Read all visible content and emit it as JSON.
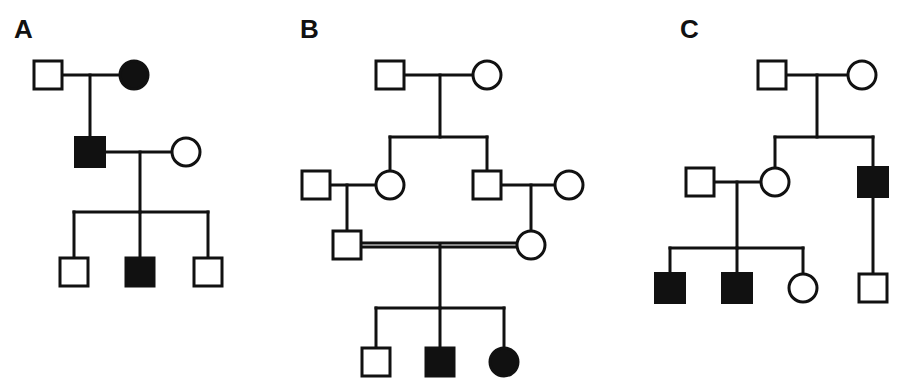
{
  "figure": {
    "background_color": "#ffffff",
    "line_color": "#111111",
    "affected_fill": "#111111",
    "unaffected_fill": "#ffffff",
    "stroke_width": 3,
    "width": 905,
    "height": 391
  },
  "legend_semantics": {
    "square": "male",
    "circle": "female",
    "filled": "affected",
    "open": "unaffected",
    "double_horizontal_line": "consanguineous mating"
  },
  "panels": [
    {
      "id": "A",
      "label": "A",
      "label_x": 14,
      "label_y": 38,
      "generations": 3,
      "individuals": [
        {
          "id": "A-I-1",
          "shape": "square",
          "sex": "male",
          "affected": false,
          "generation": 1,
          "cx": 48,
          "cy": 75,
          "size": 28
        },
        {
          "id": "A-I-2",
          "shape": "circle",
          "sex": "female",
          "affected": true,
          "generation": 1,
          "cx": 134,
          "cy": 75,
          "size": 28
        },
        {
          "id": "A-II-1",
          "shape": "square",
          "sex": "male",
          "affected": true,
          "generation": 2,
          "cx": 90,
          "cy": 152,
          "size": 29
        },
        {
          "id": "A-II-2",
          "shape": "circle",
          "sex": "female",
          "affected": false,
          "generation": 2,
          "cx": 186,
          "cy": 152,
          "size": 28
        },
        {
          "id": "A-III-1",
          "shape": "square",
          "sex": "male",
          "affected": false,
          "generation": 3,
          "cx": 74,
          "cy": 272,
          "size": 28
        },
        {
          "id": "A-III-2",
          "shape": "square",
          "sex": "male",
          "affected": true,
          "generation": 3,
          "cx": 140,
          "cy": 272,
          "size": 28
        },
        {
          "id": "A-III-3",
          "shape": "square",
          "sex": "male",
          "affected": false,
          "generation": 3,
          "cx": 208,
          "cy": 272,
          "size": 28
        }
      ],
      "matings": [
        {
          "id": "A-mating-1",
          "type": "single",
          "x1": 62,
          "x2": 120,
          "y": 75,
          "drop_x": 90,
          "drop_to": 138
        },
        {
          "id": "A-mating-2",
          "type": "single",
          "x1": 105,
          "x2": 172,
          "y": 152,
          "drop_x": 140,
          "drop_to": 212
        }
      ],
      "sibships": [
        {
          "id": "A-sibship-1",
          "y": 212,
          "x1": 74,
          "x2": 208,
          "children_x": [
            74,
            140,
            208
          ],
          "child_top": 258
        }
      ]
    },
    {
      "id": "B",
      "label": "B",
      "label_x": 300,
      "label_y": 38,
      "generations": 4,
      "individuals": [
        {
          "id": "B-I-1",
          "shape": "square",
          "sex": "male",
          "affected": false,
          "generation": 1,
          "cx": 390,
          "cy": 75,
          "size": 28
        },
        {
          "id": "B-I-2",
          "shape": "circle",
          "sex": "female",
          "affected": false,
          "generation": 1,
          "cx": 487,
          "cy": 75,
          "size": 28
        },
        {
          "id": "B-II-1",
          "shape": "square",
          "sex": "male",
          "affected": false,
          "generation": 2,
          "cx": 316,
          "cy": 185,
          "size": 28
        },
        {
          "id": "B-II-2",
          "shape": "circle",
          "sex": "female",
          "affected": false,
          "generation": 2,
          "cx": 390,
          "cy": 185,
          "size": 28
        },
        {
          "id": "B-II-3",
          "shape": "square",
          "sex": "male",
          "affected": false,
          "generation": 2,
          "cx": 487,
          "cy": 185,
          "size": 28
        },
        {
          "id": "B-II-4",
          "shape": "circle",
          "sex": "female",
          "affected": false,
          "generation": 2,
          "cx": 569,
          "cy": 185,
          "size": 28
        },
        {
          "id": "B-III-1",
          "shape": "square",
          "sex": "male",
          "affected": false,
          "generation": 3,
          "cx": 347,
          "cy": 245,
          "size": 28
        },
        {
          "id": "B-III-2",
          "shape": "circle",
          "sex": "female",
          "affected": false,
          "generation": 3,
          "cx": 531,
          "cy": 245,
          "size": 28
        },
        {
          "id": "B-IV-1",
          "shape": "square",
          "sex": "male",
          "affected": false,
          "generation": 4,
          "cx": 376,
          "cy": 362,
          "size": 28
        },
        {
          "id": "B-IV-2",
          "shape": "square",
          "sex": "male",
          "affected": true,
          "generation": 4,
          "cx": 440,
          "cy": 362,
          "size": 28
        },
        {
          "id": "B-IV-3",
          "shape": "circle",
          "sex": "female",
          "affected": true,
          "generation": 4,
          "cx": 504,
          "cy": 362,
          "size": 28
        }
      ],
      "matings": [
        {
          "id": "B-mating-1",
          "type": "single",
          "x1": 404,
          "x2": 473,
          "y": 75,
          "drop_x": 440,
          "drop_to": 137
        },
        {
          "id": "B-mating-2",
          "type": "single",
          "x1": 330,
          "x2": 376,
          "y": 185,
          "drop_x": 347,
          "drop_to": 231
        },
        {
          "id": "B-mating-3",
          "type": "single",
          "x1": 501,
          "x2": 555,
          "y": 185,
          "drop_x": 531,
          "drop_to": 231
        },
        {
          "id": "B-mating-4",
          "type": "double",
          "x1": 361,
          "x2": 517,
          "y": 245,
          "offset": 4,
          "drop_x": 440,
          "drop_to": 308
        }
      ],
      "sibships": [
        {
          "id": "B-sibship-1",
          "y": 137,
          "x1": 390,
          "x2": 487,
          "children_x": [
            390,
            487
          ],
          "child_top": 171
        },
        {
          "id": "B-sibship-2",
          "y": 308,
          "x1": 376,
          "x2": 504,
          "children_x": [
            376,
            440,
            504
          ],
          "child_top": 348
        }
      ]
    },
    {
      "id": "C",
      "label": "C",
      "label_x": 680,
      "label_y": 38,
      "generations": 3,
      "individuals": [
        {
          "id": "C-I-1",
          "shape": "square",
          "sex": "male",
          "affected": false,
          "generation": 1,
          "cx": 772,
          "cy": 75,
          "size": 28
        },
        {
          "id": "C-I-2",
          "shape": "circle",
          "sex": "female",
          "affected": false,
          "generation": 1,
          "cx": 862,
          "cy": 75,
          "size": 28
        },
        {
          "id": "C-II-1",
          "shape": "square",
          "sex": "male",
          "affected": false,
          "generation": 2,
          "cx": 700,
          "cy": 182,
          "size": 28
        },
        {
          "id": "C-II-2",
          "shape": "circle",
          "sex": "female",
          "affected": false,
          "generation": 2,
          "cx": 775,
          "cy": 182,
          "size": 28
        },
        {
          "id": "C-II-3",
          "shape": "square",
          "sex": "male",
          "affected": true,
          "generation": 2,
          "cx": 873,
          "cy": 182,
          "size": 29
        },
        {
          "id": "C-III-1",
          "shape": "square",
          "sex": "male",
          "affected": true,
          "generation": 3,
          "cx": 670,
          "cy": 288,
          "size": 29
        },
        {
          "id": "C-III-2",
          "shape": "square",
          "sex": "male",
          "affected": true,
          "generation": 3,
          "cx": 737,
          "cy": 288,
          "size": 29
        },
        {
          "id": "C-III-3",
          "shape": "circle",
          "sex": "female",
          "affected": false,
          "generation": 3,
          "cx": 803,
          "cy": 288,
          "size": 28
        },
        {
          "id": "C-III-4",
          "shape": "square",
          "sex": "male",
          "affected": false,
          "generation": 3,
          "cx": 873,
          "cy": 288,
          "size": 28
        }
      ],
      "matings": [
        {
          "id": "C-mating-1",
          "type": "single",
          "x1": 786,
          "x2": 848,
          "y": 75,
          "drop_x": 817,
          "drop_to": 137
        },
        {
          "id": "C-mating-2",
          "type": "single",
          "x1": 714,
          "x2": 761,
          "y": 182,
          "drop_x": 737,
          "drop_to": 248
        }
      ],
      "sibships": [
        {
          "id": "C-sibship-1",
          "y": 137,
          "x1": 775,
          "x2": 873,
          "children_x": [
            775,
            873
          ],
          "child_top": 168
        },
        {
          "id": "C-sibship-2",
          "y": 248,
          "x1": 670,
          "x2": 803,
          "children_x": [
            670,
            737,
            803
          ],
          "child_top": 274
        }
      ],
      "extra_links": [
        {
          "id": "C-link-1",
          "from": "C-II-3",
          "to": "C-III-4",
          "x": 873,
          "y1": 197,
          "y2": 274
        }
      ]
    }
  ]
}
